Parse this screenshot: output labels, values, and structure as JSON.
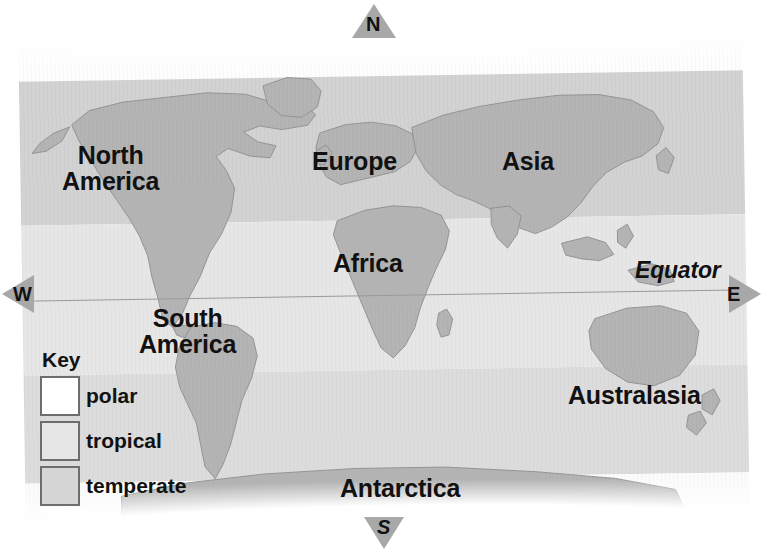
{
  "map": {
    "title": "World climate zones map",
    "continents": [
      {
        "name": "north-america",
        "label": "North\nAmerica"
      },
      {
        "name": "south-america",
        "label": "South\nAmerica"
      },
      {
        "name": "europe",
        "label": "Europe"
      },
      {
        "name": "asia",
        "label": "Asia"
      },
      {
        "name": "africa",
        "label": "Africa"
      },
      {
        "name": "australasia",
        "label": "Australasia"
      },
      {
        "name": "antarctica",
        "label": "Antarctica"
      }
    ],
    "equator_label": "Equator",
    "compass": {
      "north": "N",
      "south": "S",
      "east": "E",
      "west": "W"
    },
    "key": {
      "title": "Key",
      "entries": [
        {
          "id": "polar",
          "label": "polar",
          "color": "#ffffff"
        },
        {
          "id": "tropical",
          "label": "tropical",
          "color": "#e6e6e6"
        },
        {
          "id": "temperate",
          "label": "temperate",
          "color": "#d6d6d6"
        }
      ]
    },
    "colors": {
      "land": "#b4b4b4",
      "land_outline": "#8f8f8f",
      "polar_band": "#fdfdfd",
      "temperate_band": "#d2d2d2",
      "tropical_band": "#e6e6e6",
      "equator_line": "#9a9a9a",
      "compass_arrow": "#a8a8a8",
      "text": "#111111"
    }
  }
}
